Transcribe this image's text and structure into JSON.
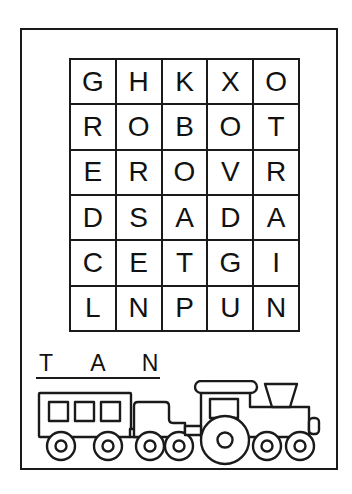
{
  "worksheet": {
    "title": "Word Search Puzzle Worksheet",
    "ink_color": "#1a1a1a",
    "paper_color": "#ffffff"
  },
  "grid": {
    "name": "letter-search-grid",
    "columns": 5,
    "rows": 6,
    "letters": [
      [
        "G",
        "H",
        "K",
        "X",
        "O"
      ],
      [
        "R",
        "O",
        "B",
        "O",
        "T"
      ],
      [
        "E",
        "R",
        "O",
        "V",
        "R"
      ],
      [
        "D",
        "S",
        "A",
        "D",
        "A"
      ],
      [
        "C",
        "E",
        "T",
        "G",
        "I"
      ],
      [
        "L",
        "N",
        "P",
        "U",
        "N"
      ]
    ],
    "flat_letters": [
      "G",
      "H",
      "K",
      "X",
      "O",
      "R",
      "O",
      "B",
      "O",
      "T",
      "E",
      "R",
      "O",
      "V",
      "R",
      "D",
      "S",
      "A",
      "D",
      "A",
      "C",
      "E",
      "T",
      "G",
      "I",
      "L",
      "N",
      "P",
      "U",
      "N"
    ]
  },
  "hint": {
    "name": "word-hint-blanks",
    "slots": [
      "T",
      "_",
      "A",
      "_",
      "N"
    ],
    "display": "T _ A _ N",
    "letters_shown": [
      "T",
      "A",
      "N"
    ]
  },
  "illustration": {
    "name": "train-illustration",
    "subject": "steam train",
    "style": "black-and-white line art",
    "cars": [
      {
        "name": "passenger-car",
        "windows": 3,
        "wheels": 2
      },
      {
        "name": "tender-car",
        "windows": 0,
        "wheels": 2
      },
      {
        "name": "locomotive",
        "windows": 1,
        "wheels": 3,
        "features": [
          "cab-roof",
          "smokestack",
          "coupler"
        ]
      }
    ]
  }
}
